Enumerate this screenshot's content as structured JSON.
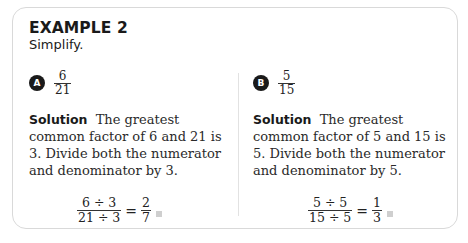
{
  "header": {
    "title": "EXAMPLE 2",
    "instruction": "Simplify."
  },
  "parts": [
    {
      "badge": "A",
      "fraction": {
        "numerator": "6",
        "denominator": "21"
      },
      "solution_label": "Solution",
      "solution_text": "The greatest common factor of 6 and 21 is 3. Divide both the numerator and denominator by 3.",
      "equation": {
        "left_numerator": "6 ÷ 3",
        "left_denominator": "21 ÷ 3",
        "equals": "=",
        "right_numerator": "2",
        "right_denominator": "7"
      }
    },
    {
      "badge": "B",
      "fraction": {
        "numerator": "5",
        "denominator": "15"
      },
      "solution_label": "Solution",
      "solution_text": "The greatest common factor of 5 and 15 is 5. Divide both the numerator and denominator by 5.",
      "equation": {
        "left_numerator": "5 ÷ 5",
        "left_denominator": "15 ÷ 5",
        "equals": "=",
        "right_numerator": "1",
        "right_denominator": "3"
      }
    }
  ],
  "icons": {
    "end_marker": "end-of-solution-square"
  }
}
